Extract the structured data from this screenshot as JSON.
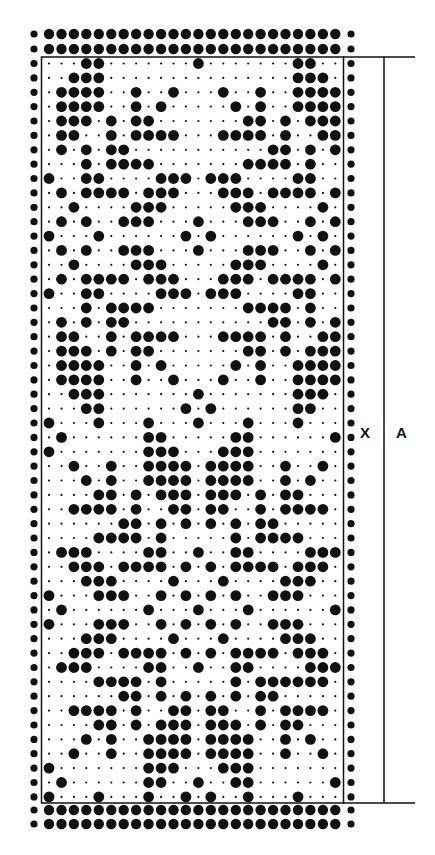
{
  "diagram": {
    "type": "knitting punch card pattern",
    "labels": {
      "marker": "X",
      "length": "A"
    },
    "colors": {
      "ink": "#111111",
      "paper": "#ffffff"
    },
    "grid": {
      "columns": 24,
      "rows": 52,
      "edge_columns_filled": true,
      "top_edge_rows": 2,
      "bottom_edge_rows": 2
    },
    "rows_filled": [
      [
        3,
        4,
        12,
        20,
        21
      ],
      [
        2,
        3,
        4,
        20,
        21,
        22
      ],
      [
        1,
        2,
        3,
        4,
        7,
        10,
        14,
        17,
        20,
        21,
        22,
        23
      ],
      [
        1,
        2,
        3,
        4,
        7,
        9,
        15,
        17,
        20,
        21,
        22,
        23
      ],
      [
        1,
        2,
        3,
        5,
        7,
        8,
        16,
        17,
        19,
        21,
        22,
        23
      ],
      [
        1,
        2,
        5,
        7,
        8,
        9,
        10,
        14,
        15,
        16,
        17,
        19,
        22,
        23
      ],
      [
        1,
        3,
        5,
        6,
        18,
        19,
        21,
        23
      ],
      [
        3,
        5,
        6,
        7,
        8,
        16,
        17,
        18,
        19,
        21
      ],
      [
        0,
        3,
        4,
        9,
        10,
        11,
        13,
        14,
        15,
        20,
        21
      ],
      [
        1,
        3,
        4,
        5,
        6,
        8,
        9,
        10,
        14,
        15,
        16,
        18,
        19,
        20,
        21,
        23
      ],
      [
        2,
        7,
        8,
        9,
        15,
        16,
        17,
        22
      ],
      [
        1,
        3,
        6,
        7,
        8,
        12,
        16,
        17,
        18,
        21,
        23
      ],
      [
        0,
        4,
        11,
        13,
        20,
        22
      ],
      [
        1,
        3,
        6,
        7,
        8,
        12,
        16,
        17,
        18,
        21,
        23
      ],
      [
        2,
        7,
        8,
        9,
        15,
        16,
        17,
        22
      ],
      [
        1,
        3,
        4,
        5,
        6,
        8,
        9,
        10,
        14,
        15,
        16,
        18,
        19,
        20,
        21,
        23
      ],
      [
        0,
        3,
        4,
        9,
        10,
        11,
        13,
        14,
        15,
        20,
        21
      ],
      [
        3,
        5,
        6,
        7,
        8,
        16,
        17,
        18,
        19,
        21
      ],
      [
        1,
        3,
        5,
        6,
        18,
        19,
        21,
        23
      ],
      [
        1,
        2,
        5,
        7,
        8,
        9,
        10,
        14,
        15,
        16,
        17,
        19,
        22,
        23
      ],
      [
        1,
        2,
        3,
        5,
        7,
        8,
        16,
        17,
        19,
        21,
        22,
        23
      ],
      [
        1,
        2,
        3,
        4,
        7,
        9,
        15,
        17,
        20,
        21,
        22,
        23
      ],
      [
        1,
        2,
        3,
        4,
        7,
        10,
        14,
        17,
        20,
        21,
        22,
        23
      ],
      [
        2,
        3,
        4,
        12,
        20,
        21,
        22
      ],
      [
        3,
        4,
        11,
        13,
        20,
        21
      ],
      [
        0,
        4,
        8,
        12,
        16,
        20
      ],
      [
        1,
        8,
        9,
        15,
        16,
        23
      ],
      [
        0,
        8,
        9,
        10,
        14,
        15,
        16
      ],
      [
        2,
        5,
        8,
        9,
        10,
        11,
        13,
        14,
        15,
        16,
        19,
        22
      ],
      [
        3,
        5,
        8,
        9,
        10,
        11,
        13,
        14,
        15,
        16,
        19,
        21
      ],
      [
        4,
        5,
        7,
        9,
        10,
        11,
        13,
        14,
        15,
        17,
        19,
        20
      ],
      [
        2,
        3,
        4,
        5,
        7,
        10,
        11,
        13,
        14,
        17,
        19,
        20,
        21,
        22
      ],
      [
        6,
        7,
        9,
        11,
        13,
        15,
        17,
        18
      ],
      [
        4,
        5,
        6,
        7,
        9,
        15,
        17,
        18,
        19,
        20
      ],
      [
        1,
        2,
        3,
        8,
        9,
        12,
        15,
        16,
        21,
        22,
        23
      ],
      [
        2,
        3,
        4,
        6,
        7,
        8,
        9,
        11,
        13,
        15,
        16,
        17,
        18,
        20,
        21,
        22
      ],
      [
        3,
        4,
        5,
        10,
        14,
        19,
        20,
        21
      ],
      [
        0,
        4,
        5,
        6,
        9,
        11,
        13,
        15,
        18,
        19,
        20
      ],
      [
        1,
        8,
        12,
        16,
        23
      ],
      [
        0,
        4,
        5,
        6,
        9,
        11,
        13,
        15,
        18,
        19,
        20
      ],
      [
        3,
        4,
        5,
        10,
        14,
        19,
        20,
        21
      ],
      [
        2,
        3,
        4,
        6,
        7,
        8,
        9,
        11,
        13,
        15,
        16,
        17,
        18,
        20,
        21,
        22
      ],
      [
        1,
        2,
        3,
        8,
        9,
        12,
        15,
        16,
        21,
        22,
        23
      ],
      [
        4,
        5,
        6,
        7,
        9,
        15,
        17,
        18,
        19,
        20,
        21,
        22
      ],
      [
        6,
        7,
        9,
        11,
        13,
        15,
        17,
        18
      ],
      [
        2,
        3,
        4,
        5,
        7,
        10,
        11,
        13,
        14,
        17,
        19,
        20,
        21,
        22
      ],
      [
        4,
        5,
        7,
        9,
        10,
        11,
        13,
        14,
        15,
        17,
        19,
        20
      ],
      [
        3,
        5,
        8,
        9,
        10,
        11,
        13,
        14,
        15,
        16,
        19,
        21
      ],
      [
        2,
        5,
        8,
        9,
        10,
        11,
        13,
        14,
        15,
        16,
        19,
        22
      ],
      [
        0,
        8,
        9,
        10,
        14,
        15,
        16
      ],
      [
        1,
        8,
        9,
        12,
        15,
        16,
        23
      ],
      [
        0,
        4,
        8,
        11,
        13,
        16,
        20
      ]
    ]
  }
}
